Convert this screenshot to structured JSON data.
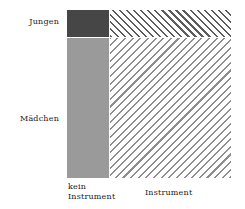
{
  "chart_data": {
    "type": "mosaic",
    "title": "",
    "xlabel": "",
    "ylabel": "",
    "grid": false,
    "legend": "none",
    "row_variable": "Geschlecht",
    "column_variable": "Instrument",
    "row_categories": [
      "Jungen",
      "Mädchen"
    ],
    "column_categories": [
      "kein Instrument",
      "Instrument"
    ],
    "column_widths_pct": [
      25.6,
      74.4
    ],
    "row_heights_pct": [
      16.0,
      84.0
    ],
    "cells": [
      {
        "row": "Jungen",
        "column": "kein Instrument",
        "fill": "solid",
        "color": "#464646",
        "width_pct": 25.6,
        "height_pct": 16.0
      },
      {
        "row": "Jungen",
        "column": "Instrument",
        "fill": "hatch",
        "hatch_direction": "up",
        "color": "#5c5c5c",
        "width_pct": 74.4,
        "height_pct": 16.0
      },
      {
        "row": "Mädchen",
        "column": "kein Instrument",
        "fill": "solid",
        "color": "#9a9a9a",
        "width_pct": 25.6,
        "height_pct": 84.0
      },
      {
        "row": "Mädchen",
        "column": "Instrument",
        "fill": "hatch",
        "hatch_direction": "down",
        "color": "#8e8e8e",
        "width_pct": 74.4,
        "height_pct": 84.0
      }
    ]
  },
  "labels": {
    "row_jungen": "Jungen",
    "row_maedchen": "Mädchen",
    "col_kein_instrument": "kein\nInstrument",
    "col_instrument": "Instrument"
  },
  "colors": {
    "background": "#ffffff",
    "text": "#1a1a1a",
    "cell_dark": "#464646",
    "cell_mid": "#9a9a9a",
    "hatch_dense": "#5c5c5c",
    "hatch_sparse": "#8e8e8e"
  }
}
